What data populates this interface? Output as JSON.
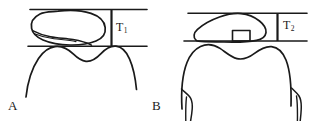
{
  "figure": {
    "type": "line-drawing",
    "background_color": "#ffffff",
    "stroke_color": "#1a1a1a",
    "panels": [
      {
        "id": "A",
        "label": "A",
        "measurement": {
          "name": "T1",
          "base": "T",
          "subscript": "1",
          "orientation": "vertical"
        },
        "shapes": [
          "upper-reference-line",
          "lower-reference-line",
          "irregular-blob-outline",
          "inner-crease-curve",
          "tooth-crown-outline",
          "vertical-measure-bar"
        ]
      },
      {
        "id": "B",
        "label": "B",
        "measurement": {
          "name": "T2",
          "base": "T",
          "subscript": "2",
          "orientation": "vertical"
        },
        "shapes": [
          "upper-reference-line",
          "lower-reference-line",
          "lens-shaped-outline",
          "small-square-marker",
          "tooth-crown-outline",
          "tooth-root-left",
          "tooth-root-right",
          "vertical-measure-bar"
        ]
      }
    ]
  },
  "labels": {
    "panel_a": "A",
    "panel_b": "B",
    "t1_base": "T",
    "t1_sub": "1",
    "t2_base": "T",
    "t2_sub": "2"
  },
  "colors": {
    "stroke": "#1a1a1a",
    "background": "#ffffff"
  }
}
